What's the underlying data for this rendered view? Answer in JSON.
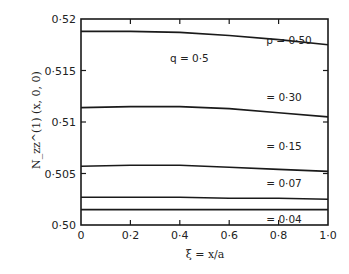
{
  "chart_data": {
    "type": "line",
    "title": "",
    "xlabel": "ξ = x/a",
    "ylabel": "N_zz^(1) (x, 0, 0)",
    "xlim": [
      0,
      1.0
    ],
    "ylim": [
      0.5,
      0.52
    ],
    "grid": false,
    "x_ticks": [
      0,
      0.2,
      0.4,
      0.6,
      0.8,
      1.0
    ],
    "x_tick_labels": [
      "0",
      "0·2",
      "0·4",
      "0·6",
      "0·8",
      "1·0"
    ],
    "y_ticks": [
      0.5,
      0.505,
      0.51,
      0.515,
      0.52
    ],
    "y_tick_labels": [
      "0·50",
      "0·505",
      "0·51",
      "0·515",
      "0·52"
    ],
    "x": [
      0,
      0.2,
      0.4,
      0.6,
      0.8,
      1.0
    ],
    "series": [
      {
        "name": "p = 0.50",
        "values": [
          0.5188,
          0.5188,
          0.5187,
          0.5184,
          0.518,
          0.5175
        ]
      },
      {
        "name": "p = 0.30",
        "values": [
          0.5114,
          0.5115,
          0.5115,
          0.5113,
          0.5109,
          0.5105
        ]
      },
      {
        "name": "p = 0.15",
        "values": [
          0.5057,
          0.5058,
          0.5058,
          0.5056,
          0.5054,
          0.5052
        ]
      },
      {
        "name": "p = 0.07",
        "values": [
          0.5027,
          0.5027,
          0.5027,
          0.5026,
          0.5026,
          0.5025
        ]
      },
      {
        "name": "p = 0.04",
        "values": [
          0.5015,
          0.5015,
          0.5015,
          0.5015,
          0.5015,
          0.5015
        ]
      }
    ],
    "annotations": [
      {
        "text": "q = 0·5",
        "x": 0.36,
        "y": 0.5158
      },
      {
        "text": "p = 0·50",
        "x": 0.75,
        "y": 0.5176
      },
      {
        "text": "= 0·30",
        "x": 0.75,
        "y": 0.512
      },
      {
        "text": "= 0·15",
        "x": 0.75,
        "y": 0.5073
      },
      {
        "text": "= 0·07",
        "x": 0.75,
        "y": 0.5037
      },
      {
        "text": "= 0·04",
        "x": 0.75,
        "y": 0.5002
      }
    ]
  }
}
